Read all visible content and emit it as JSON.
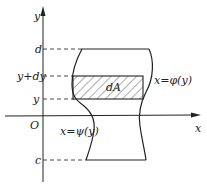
{
  "diagram": {
    "type": "area-element-between-curves",
    "axes": {
      "x_label": "x",
      "y_label": "y",
      "origin_label": "O"
    },
    "y_levels": {
      "d": "d",
      "y_plus_dy": "y+dy",
      "y": "y",
      "c": "c"
    },
    "curves": {
      "right": "x=φ(y)",
      "left": "x=ψ(y)"
    },
    "strip_label": "dA",
    "colors": {
      "stroke": "#222222",
      "background": "#ffffff"
    }
  }
}
